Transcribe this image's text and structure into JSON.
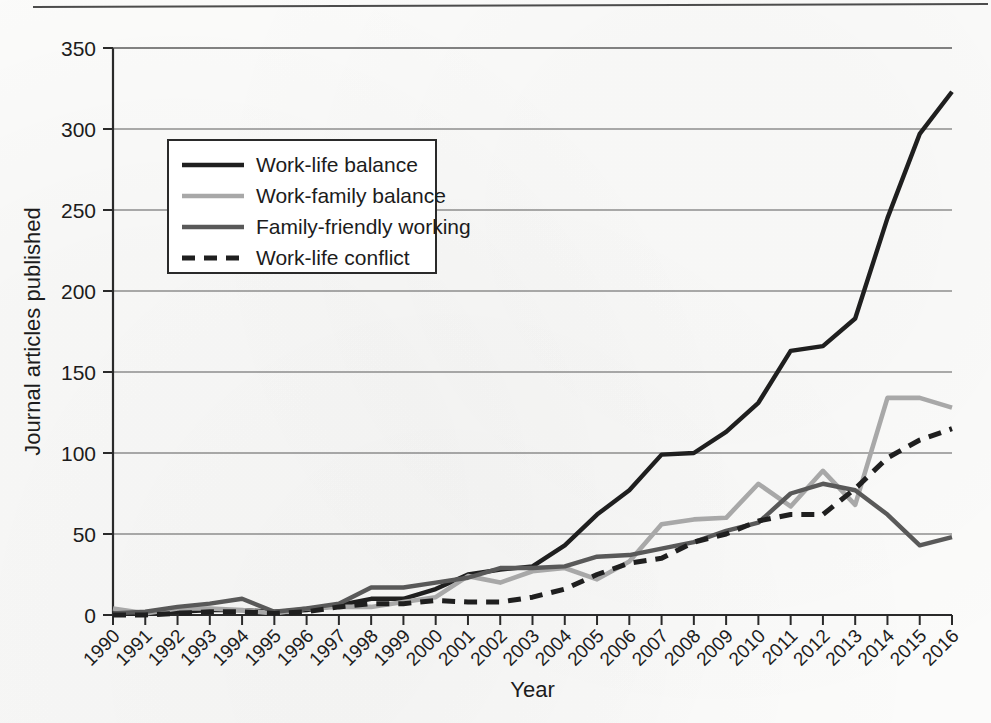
{
  "figure": {
    "has_top_rule": true,
    "background_color": "#fbfbfa"
  },
  "chart_data": {
    "type": "line",
    "title": "",
    "xlabel": "Year",
    "ylabel": "Journal articles published",
    "xlim": [
      1990,
      2016
    ],
    "ylim": [
      0,
      350
    ],
    "ytick_step": 50,
    "grid": "horizontal",
    "legend_position": "upper-left-inside",
    "categories": [
      "1990",
      "1991",
      "1992",
      "1993",
      "1994",
      "1995",
      "1996",
      "1997",
      "1998",
      "1999",
      "2000",
      "2001",
      "2002",
      "2003",
      "2004",
      "2005",
      "2006",
      "2007",
      "2008",
      "2009",
      "2010",
      "2011",
      "2012",
      "2013",
      "2014",
      "2015",
      "2016"
    ],
    "yticks": [
      "0",
      "50",
      "100",
      "150",
      "200",
      "250",
      "300",
      "350"
    ],
    "series": [
      {
        "name": "Work-life balance",
        "color": "#1f1f1f",
        "style": "solid",
        "width": 4.4,
        "values": [
          1,
          1,
          2,
          3,
          3,
          2,
          3,
          6,
          10,
          10,
          16,
          25,
          28,
          30,
          43,
          62,
          77,
          99,
          100,
          113,
          131,
          163,
          166,
          183,
          245,
          297,
          323
        ]
      },
      {
        "name": "Work-family balance",
        "color": "#a8a8a8",
        "style": "solid",
        "width": 4.6,
        "values": [
          4,
          1,
          4,
          4,
          3,
          1,
          4,
          5,
          5,
          8,
          11,
          24,
          20,
          27,
          29,
          22,
          33,
          56,
          59,
          60,
          81,
          67,
          89,
          68,
          134,
          134,
          128
        ]
      },
      {
        "name": "Family-friendly working",
        "color": "#595959",
        "style": "solid",
        "width": 4.4,
        "values": [
          1,
          2,
          5,
          7,
          10,
          2,
          4,
          7,
          17,
          17,
          20,
          23,
          29,
          29,
          30,
          36,
          37,
          41,
          45,
          52,
          57,
          75,
          81,
          77,
          62,
          43,
          48
        ]
      },
      {
        "name": "Work-life conflict",
        "color": "#1f1f1f",
        "style": "dashed",
        "width": 5.0,
        "dash": "13,9",
        "values": [
          0,
          0,
          1,
          2,
          2,
          1,
          2,
          5,
          7,
          7,
          9,
          8,
          8,
          11,
          16,
          25,
          32,
          35,
          45,
          50,
          58,
          62,
          62,
          78,
          97,
          108,
          115
        ]
      }
    ]
  }
}
